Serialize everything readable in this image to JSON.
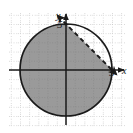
{
  "figure": {
    "caption": "",
    "axes": {
      "x_axis_label": "x",
      "y_axis_label": "y",
      "x_tick_label": "5",
      "y_tick_label": "5",
      "origin_px": [
        66,
        70
      ],
      "unit_px": 9.2,
      "x_range": [
        -6,
        6
      ],
      "y_range": [
        -6,
        6
      ],
      "grid": "dotted",
      "grid_color": "#c9c9c9",
      "axis_color": "#1a1a1a"
    },
    "colors": {
      "shaded_region": "#9a9a9a",
      "circle_stroke": "#1a1a1a",
      "dashed_line": "#1a1a1a",
      "background": "#ffffff"
    }
  },
  "chart_data": {
    "type": "scatter",
    "title": "",
    "subtitle": "",
    "xlabel": "x",
    "ylabel": "y",
    "xlim": [
      -6.1,
      6.1
    ],
    "ylim": [
      -6.1,
      6.1
    ],
    "grid": true,
    "grid_style": "dotted",
    "legend": null,
    "xticks": [
      5
    ],
    "yticks": [
      5
    ],
    "xtick_labels": [
      "5"
    ],
    "ytick_labels": [
      "5"
    ],
    "annotations": [
      {
        "kind": "circle",
        "label": "x^2 + y^2 = 25",
        "center": [
          0,
          0
        ],
        "radius": 5,
        "stroke": "solid",
        "fill": "none",
        "boundary_included": true
      },
      {
        "kind": "line",
        "label": "x + y = 5",
        "slope": -1,
        "intercept": 5,
        "stroke": "dashed",
        "boundary_included": false,
        "arrow_start": [
          -5.6,
          10.6
        ],
        "arrow_end": [
          6.0,
          -1.0
        ],
        "arrowheads": "both"
      },
      {
        "kind": "shaded_region",
        "label": "x^2 + y^2 <= 25 and x + y < 5",
        "fill": "#9a9a9a",
        "description": "interior of the circle below and left of the dashed line"
      }
    ],
    "series": [
      {
        "name": "circle boundary",
        "type": "circle",
        "center_x": 0,
        "center_y": 0,
        "radius": 5
      },
      {
        "name": "dashed boundary line",
        "type": "line",
        "x": [
          -5.6,
          6.0
        ],
        "y": [
          10.6,
          -1.0
        ]
      }
    ]
  }
}
